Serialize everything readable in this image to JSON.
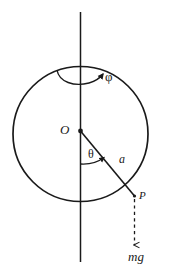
{
  "figure": {
    "type": "physics-diagram",
    "background_color": "#ffffff",
    "ink_color": "#1a1a1a",
    "width": 179,
    "height": 272,
    "labels": {
      "center_point": "O",
      "polar_angle": "θ",
      "radius": "a",
      "azimuthal_angle": "φ",
      "particle_point": "P",
      "weight_force": "mg"
    },
    "geometry": {
      "circle": {
        "cx": 80.5,
        "cy": 134,
        "r": 67.5
      },
      "vertical_axis": {
        "x": 80.5,
        "y1": 12,
        "y2": 262
      },
      "radius_line": {
        "x1": 80.5,
        "y1": 131,
        "x2": 134,
        "y2": 196
      },
      "point_P": {
        "x": 134,
        "y": 196
      },
      "gravity_arrow": {
        "x": 134,
        "y1": 198,
        "y2": 247
      },
      "theta_arc_radius": 30,
      "phi_arc": {
        "cx": 80.5,
        "cy": 74,
        "rx": 22,
        "ry": 9
      }
    }
  }
}
